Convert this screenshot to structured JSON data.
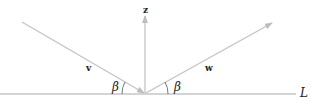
{
  "diagram": {
    "type": "vector reflection",
    "labels": {
      "z": "z",
      "v": "v",
      "w": "w",
      "beta_left": "β",
      "beta_right": "β",
      "line": "L"
    },
    "colors": {
      "vector": "#c3c3c3",
      "line": "#a9a9a9",
      "text": "#222222"
    }
  }
}
